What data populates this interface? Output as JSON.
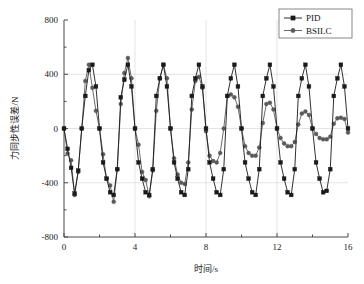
{
  "chart_data": {
    "type": "line",
    "title": "",
    "xlabel": "时间/s",
    "ylabel": "力同步性误差/N",
    "xlim": [
      0,
      16
    ],
    "ylim": [
      -800,
      800
    ],
    "xticks": [
      0,
      4,
      8,
      12,
      16
    ],
    "yticks": [
      -800,
      -400,
      0,
      400,
      800
    ],
    "xtick_labels": [
      "0",
      "4",
      "8",
      "12",
      "16"
    ],
    "ytick_labels": [
      "-800",
      "-400",
      "0",
      "400",
      "800"
    ],
    "x_minor_ticks": [
      2,
      6,
      10,
      14
    ],
    "y_minor_ticks": [
      -600,
      -200,
      200,
      600
    ],
    "grid": "major-gridlines-light",
    "legend_position": "top-right",
    "series": [
      {
        "name": "PID",
        "color": "#1a1a1a",
        "marker": "square",
        "x": [
          0.0,
          0.2,
          0.4,
          0.6,
          0.8,
          1.0,
          1.2,
          1.4,
          1.6,
          1.8,
          2.0,
          2.2,
          2.4,
          2.6,
          2.8,
          3.0,
          3.2,
          3.4,
          3.6,
          3.8,
          4.0,
          4.2,
          4.4,
          4.6,
          4.8,
          5.0,
          5.2,
          5.4,
          5.6,
          5.8,
          6.0,
          6.2,
          6.4,
          6.6,
          6.8,
          7.0,
          7.2,
          7.4,
          7.6,
          7.8,
          8.0,
          8.2,
          8.4,
          8.6,
          8.8,
          9.0,
          9.2,
          9.4,
          9.6,
          9.8,
          10.0,
          10.2,
          10.4,
          10.6,
          10.8,
          11.0,
          11.2,
          11.4,
          11.6,
          11.8,
          12.0,
          12.2,
          12.4,
          12.6,
          12.8,
          13.0,
          13.2,
          13.4,
          13.6,
          13.8,
          14.0,
          14.2,
          14.4,
          14.6,
          14.8,
          15.0,
          15.2,
          15.4,
          15.6,
          15.8,
          16.0
        ],
        "y": [
          0,
          -150,
          -290,
          -480,
          -310,
          0,
          240,
          430,
          470,
          310,
          0,
          -250,
          -370,
          -470,
          -490,
          -300,
          230,
          360,
          470,
          310,
          0,
          -250,
          -370,
          -470,
          -490,
          -300,
          240,
          370,
          470,
          310,
          0,
          -250,
          -370,
          -470,
          -490,
          -300,
          240,
          370,
          470,
          310,
          0,
          -250,
          -370,
          -470,
          -490,
          -300,
          240,
          370,
          470,
          310,
          0,
          -250,
          -370,
          -470,
          -490,
          -300,
          240,
          370,
          470,
          310,
          0,
          -250,
          -370,
          -470,
          -490,
          -300,
          240,
          370,
          470,
          310,
          0,
          -250,
          -370,
          -470,
          -460,
          -300,
          240,
          370,
          470,
          310,
          0
        ]
      },
      {
        "name": "BSILC",
        "color": "#5a5a5a",
        "marker": "circle",
        "x": [
          0.0,
          0.2,
          0.4,
          0.6,
          0.8,
          1.0,
          1.2,
          1.4,
          1.6,
          1.8,
          2.0,
          2.2,
          2.4,
          2.6,
          2.8,
          3.0,
          3.2,
          3.4,
          3.6,
          3.8,
          4.0,
          4.2,
          4.4,
          4.6,
          4.8,
          5.0,
          5.2,
          5.4,
          5.6,
          5.8,
          6.0,
          6.2,
          6.4,
          6.6,
          6.8,
          7.0,
          7.2,
          7.4,
          7.6,
          7.8,
          8.0,
          8.2,
          8.4,
          8.6,
          8.8,
          9.0,
          9.2,
          9.4,
          9.6,
          9.8,
          10.0,
          10.2,
          10.4,
          10.6,
          10.8,
          11.0,
          11.2,
          11.4,
          11.6,
          11.8,
          12.0,
          12.2,
          12.4,
          12.6,
          12.8,
          13.0,
          13.2,
          13.4,
          13.6,
          13.8,
          14.0,
          14.2,
          14.4,
          14.6,
          14.8,
          15.0,
          15.2,
          15.4,
          15.6,
          15.8,
          16.0
        ],
        "y": [
          0,
          -185,
          -235,
          -490,
          -320,
          0,
          350,
          470,
          300,
          130,
          0,
          -190,
          -370,
          -420,
          -540,
          -300,
          180,
          410,
          520,
          370,
          0,
          -120,
          -320,
          -380,
          -500,
          -310,
          130,
          370,
          470,
          370,
          0,
          -220,
          -340,
          -400,
          -410,
          -250,
          140,
          350,
          380,
          300,
          -20,
          -200,
          -240,
          -250,
          -180,
          0,
          240,
          250,
          230,
          160,
          0,
          -130,
          -180,
          -200,
          -200,
          -140,
          40,
          180,
          190,
          140,
          0,
          -70,
          -110,
          -130,
          -130,
          -100,
          30,
          110,
          125,
          100,
          0,
          -40,
          -70,
          -80,
          -80,
          -60,
          35,
          75,
          80,
          70,
          -30
        ]
      }
    ]
  },
  "legend": {
    "items": [
      {
        "label": "PID",
        "marker": "square",
        "color": "#1a1a1a"
      },
      {
        "label": "BSILC",
        "marker": "circle",
        "color": "#5a5a5a"
      }
    ]
  },
  "axes": {
    "x_title": "时间/s",
    "y_title": "力同步性误差/N"
  }
}
